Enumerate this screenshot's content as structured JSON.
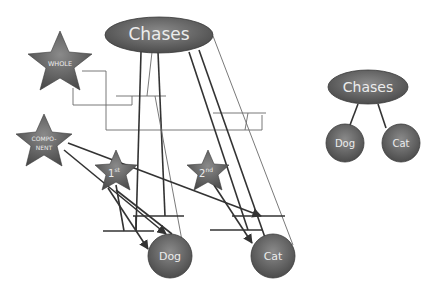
{
  "diagram": {
    "left": {
      "root": {
        "label": "Chases",
        "cx": 159,
        "cy": 35,
        "rx": 54,
        "ry": 18
      },
      "dog": {
        "label": "Dog",
        "cx": 170,
        "cy": 256,
        "r": 22
      },
      "cat": {
        "label": "Cat",
        "cx": 273,
        "cy": 256,
        "r": 22
      },
      "stars": [
        {
          "id": "whole",
          "label": "WHOLE",
          "cx": 60,
          "cy": 63,
          "r": 32
        },
        {
          "id": "component",
          "label_line1": "COMPO-",
          "label_line2": "NENT",
          "cx": 44,
          "cy": 141,
          "r": 28
        },
        {
          "id": "first",
          "label": "1",
          "sup": "st",
          "cx": 116,
          "cy": 172,
          "r": 22
        },
        {
          "id": "second",
          "label": "2",
          "sup": "nd",
          "cx": 208,
          "cy": 172,
          "r": 22
        }
      ]
    },
    "right": {
      "root": {
        "label": "Chases",
        "cx": 368,
        "cy": 87,
        "rx": 40,
        "ry": 17
      },
      "dog": {
        "label": "Dog",
        "cx": 345,
        "cy": 143,
        "r": 19
      },
      "cat": {
        "label": "Cat",
        "cx": 401,
        "cy": 143,
        "r": 19
      }
    },
    "colors": {
      "node_fill_top": "#8a8a8a",
      "node_fill_bottom": "#4a4a4a",
      "line": "#333333",
      "thin_line": "#6a6a6a",
      "label": "#ececec"
    }
  }
}
